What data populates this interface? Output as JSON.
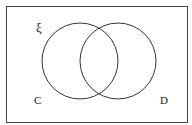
{
  "diagram": {
    "type": "venn",
    "universal_label": "ξ",
    "sets": [
      {
        "label": "C",
        "cx": 80,
        "cy": 61,
        "r": 38
      },
      {
        "label": "D",
        "cx": 118,
        "cy": 61,
        "r": 38
      }
    ],
    "colors": {
      "stroke": "#333333",
      "background": "#ffffff"
    }
  }
}
